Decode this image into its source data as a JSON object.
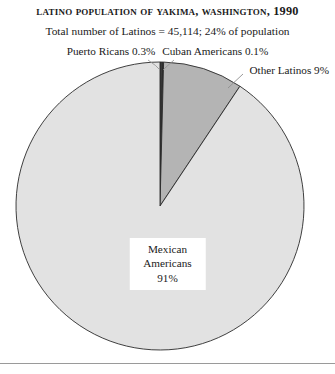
{
  "title": "Latino Population of Yakima, Washington, 1990",
  "subtitle": "Total number of Latinos = 45,114; 24% of population",
  "labels": {
    "puerto_ricans": "Puerto Ricans 0.3%",
    "cuban_americans": "Cuban Americans 0.1%",
    "other_latinos": "Other Latinos 9%",
    "center_line1": "Mexican",
    "center_line2": "Americans",
    "center_line3": "91%"
  },
  "colors": {
    "mexican": "#e2e2e2",
    "other": "#b4b4b4",
    "puerto_rican": "#3a3a3a",
    "cuban": "#3a3a3a",
    "outline": "#2b2b2b",
    "rule": "#9a9a9a",
    "text": "#1a1a1a",
    "background": "#ffffff"
  },
  "chart_data": {
    "type": "pie",
    "title": "Latino Population of Yakima, Washington, 1990",
    "subtitle": "Total number of Latinos = 45,114; 24% of population",
    "total_label": "Total number of Latinos = 45,114; 24% of population",
    "total_value": 45114,
    "share_of_population_pct": 24,
    "unit": "percent",
    "start_angle_deg": 0,
    "direction": "clockwise",
    "legend": "none",
    "labels_position": "callouts",
    "slices": [
      {
        "name": "Puerto Ricans",
        "value": 0.3,
        "label": "Puerto Ricans 0.3%",
        "color": "#3a3a3a",
        "callout": "top-left"
      },
      {
        "name": "Cuban Americans",
        "value": 0.1,
        "label": "Cuban Americans 0.1%",
        "color": "#3a3a3a",
        "callout": "top-right"
      },
      {
        "name": "Other Latinos",
        "value": 9,
        "label": "Other Latinos 9%",
        "color": "#b4b4b4",
        "callout": "right"
      },
      {
        "name": "Mexican Americans",
        "value": 91,
        "label": "Mexican Americans 91%",
        "color": "#e2e2e2",
        "callout": "center-box"
      }
    ],
    "categories": [
      "Puerto Ricans",
      "Cuban Americans",
      "Other Latinos",
      "Mexican Americans"
    ],
    "values": [
      0.3,
      0.1,
      9,
      91
    ]
  },
  "geometry": {
    "center_x": 160,
    "center_y": 206,
    "radius": 144
  }
}
